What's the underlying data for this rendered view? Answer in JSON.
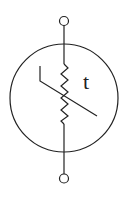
{
  "diagram": {
    "label": "t",
    "stroke_color": "#222222",
    "components": [
      {
        "id": "terminal-top",
        "type": "terminal"
      },
      {
        "id": "terminal-bottom",
        "type": "terminal"
      },
      {
        "id": "body-circle",
        "type": "circle"
      },
      {
        "id": "resistor",
        "type": "zigzag-resistor"
      },
      {
        "id": "thermal-line",
        "type": "bent-diagonal-line"
      }
    ]
  }
}
